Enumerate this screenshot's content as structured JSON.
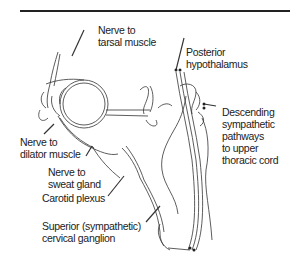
{
  "figure": {
    "labels": {
      "nerve_tarsal": [
        "Nerve to",
        "tarsal muscle"
      ],
      "posterior_hypothalamus": [
        "Posterior",
        "hypothalamus"
      ],
      "descending_pathways": [
        "Descending",
        "sympathetic",
        "pathways",
        "to upper",
        "thoracic cord"
      ],
      "nerve_dilator": [
        "Nerve to",
        "dilator muscle"
      ],
      "nerve_sweat": [
        "Nerve to",
        "sweat gland"
      ],
      "carotid_plexus": [
        "Carotid plexus"
      ],
      "superior_ganglion": [
        "Superior (sympathetic)",
        "cervical ganglion"
      ]
    }
  }
}
